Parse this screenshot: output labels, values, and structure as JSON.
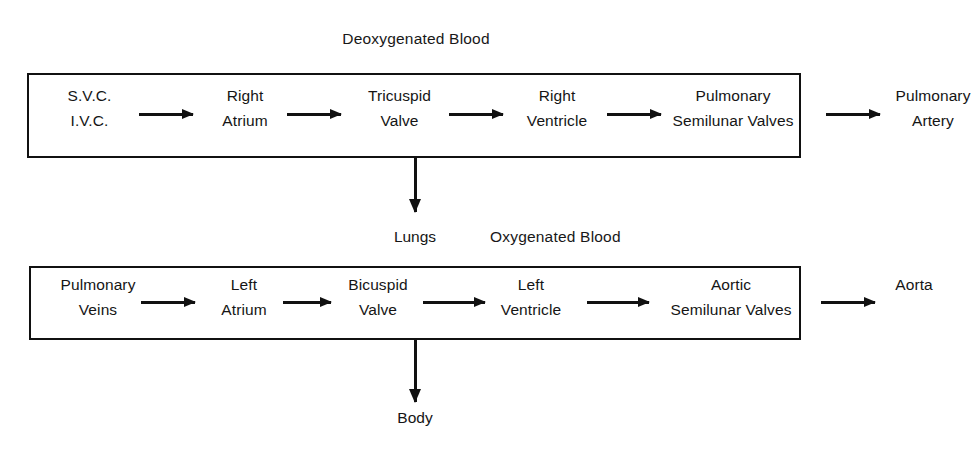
{
  "diagram": {
    "title_deoxygenated": "Deoxygenated Blood",
    "title_oxygenated": "Oxygenated Blood",
    "pathways": [
      {
        "id": "deoxygenated-pathway",
        "label": "Deoxygenated Blood",
        "nodes": [
          {
            "line1": "S.V.C.",
            "line2": "I.V.C."
          },
          {
            "line1": "Right",
            "line2": "Atrium"
          },
          {
            "line1": "Tricuspid",
            "line2": "Valve"
          },
          {
            "line1": "Right",
            "line2": "Ventricle"
          },
          {
            "line1": "Pulmonary",
            "line2": "Semilunar Valves"
          },
          {
            "line1": "Pulmonary",
            "line2": "Artery"
          }
        ]
      },
      {
        "id": "oxygenated-pathway",
        "label": "Oxygenated Blood",
        "nodes": [
          {
            "line1": "Pulmonary",
            "line2": "Veins"
          },
          {
            "line1": "Left",
            "line2": "Atrium"
          },
          {
            "line1": "Bicuspid",
            "line2": "Valve"
          },
          {
            "line1": "Left",
            "line2": "Ventricle"
          },
          {
            "line1": "Aortic",
            "line2": "Semilunar Valves"
          },
          {
            "line1": "",
            "line2": "Aorta"
          }
        ]
      }
    ],
    "destinations": {
      "lungs": "Lungs",
      "body": "Body"
    }
  }
}
